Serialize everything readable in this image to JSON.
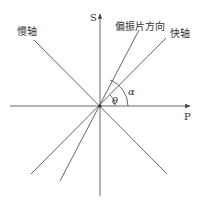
{
  "diagram": {
    "axes": {
      "vertical_label": "S",
      "horizontal_label": "P"
    },
    "lines": {
      "slow_axis_label": "慢轴",
      "polarizer_label": "偏振片方向",
      "fast_axis_label": "快轴"
    },
    "angles": {
      "theta": "θ",
      "alpha": "α"
    },
    "colors": {
      "line": "#555555",
      "text": "#333333"
    }
  }
}
